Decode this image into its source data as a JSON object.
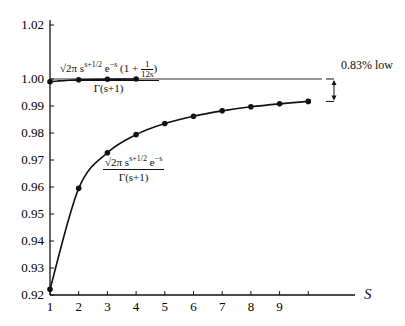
{
  "chart_data": {
    "type": "line",
    "title": "",
    "xlabel": "s",
    "ylabel": "",
    "xlim": [
      1,
      10
    ],
    "ylim": [
      0.92,
      1.02
    ],
    "x_ticks": [
      "1",
      "2",
      "3",
      "4",
      "5",
      "6",
      "7",
      "8",
      "9",
      ""
    ],
    "y_ticks": [
      "0.92",
      "0.93",
      "0.94",
      "0.95",
      "0.96",
      "0.97",
      "0.98",
      "0.99",
      "1.00",
      "1.02"
    ],
    "grid": false,
    "reference_line": {
      "y": 1.0
    },
    "series": [
      {
        "name": "√(2π) s^(s+1/2) e^(−s) (1 + 1/(12s)) / Γ(s+1)",
        "x": [
          1,
          2,
          3,
          4
        ],
        "values": [
          0.999,
          0.9997,
          0.9999,
          1.0
        ]
      },
      {
        "name": "√(2π) s^(s+1/2) e^(−s) / Γ(s+1)",
        "x": [
          1,
          2,
          3,
          4,
          5,
          6,
          7,
          8,
          9,
          10
        ],
        "values": [
          0.9221,
          0.9595,
          0.9727,
          0.9794,
          0.9835,
          0.9862,
          0.9882,
          0.9897,
          0.9908,
          0.9917
        ]
      }
    ],
    "annotations": [
      {
        "text": "0.83% low",
        "between_y": [
          0.9917,
          1.0
        ],
        "at_x": 10
      }
    ]
  },
  "labels": {
    "y": [
      "0.92",
      "0.93",
      "0.94",
      "0.95",
      "0.96",
      "0.97",
      "0.98",
      "0.99",
      "1.00",
      "1.02"
    ],
    "x": [
      "1",
      "2",
      "3",
      "4",
      "5",
      "6",
      "7",
      "8",
      "9"
    ],
    "axis_var": "S",
    "note": "0.83% low",
    "f1_num_a": "√2π s",
    "f1_sup": "s+1/2",
    "f1_num_b": " e",
    "f1_sup2": "−s",
    "f1_paren_open": " (1 + ",
    "f1_frac_top": "1",
    "f1_frac_bot": "12s",
    "f1_paren_close": ")",
    "f1_den": "Γ(s+1)",
    "f2_num_a": "√2π s",
    "f2_sup": "s+1/2",
    "f2_num_b": " e",
    "f2_sup2": "−s",
    "f2_den": "Γ(s+1)"
  }
}
